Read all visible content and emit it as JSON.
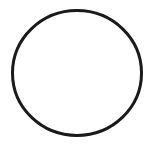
{
  "canvas": {
    "width": 155,
    "height": 144,
    "background": "#ffffff"
  },
  "shape": {
    "type": "ellipse",
    "cx": 77,
    "cy": 73,
    "rx": 64.5,
    "ry": 62.5,
    "stroke": "#1a1a1a",
    "stroke_width": 3,
    "fill": "none"
  }
}
